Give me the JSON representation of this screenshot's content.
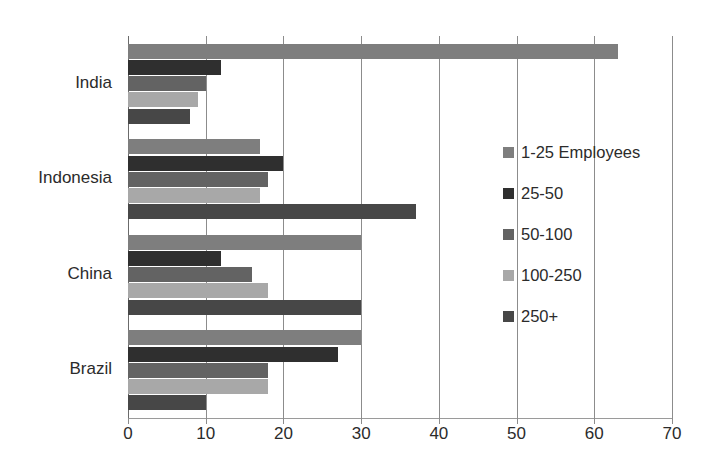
{
  "figure": {
    "top_clipped_text": "",
    "background": "#ffffff"
  },
  "chart_data": {
    "type": "bar",
    "orientation": "horizontal",
    "title": "",
    "subtitle": "",
    "xlabel": "",
    "ylabel": "",
    "xlim": [
      0,
      70
    ],
    "xticks": [
      0,
      10,
      20,
      30,
      40,
      50,
      60,
      70
    ],
    "xtick_labels": [
      "0",
      "10",
      "20",
      "30",
      "40",
      "50",
      "60",
      "70"
    ],
    "grid": "vertical",
    "legend_position": "right-inside",
    "categories": [
      "India",
      "Indonesia",
      "China",
      "Brazil"
    ],
    "series": [
      {
        "name": "1-25 Employees",
        "color": "#7e7e7e",
        "values": [
          63,
          17,
          30,
          30
        ]
      },
      {
        "name": "25-50",
        "color": "#2f2f2f",
        "values": [
          12,
          20,
          12,
          27
        ]
      },
      {
        "name": "50-100",
        "color": "#636363",
        "values": [
          10,
          18,
          16,
          18
        ]
      },
      {
        "name": "100-250",
        "color": "#a8a8a8",
        "values": [
          9,
          17,
          18,
          18
        ]
      },
      {
        "name": "250+",
        "color": "#474747",
        "values": [
          8,
          37,
          30,
          10
        ]
      }
    ]
  },
  "legend": {
    "items": [
      {
        "label": "1-25 Employees",
        "color": "#7e7e7e"
      },
      {
        "label": "25-50",
        "color": "#2f2f2f"
      },
      {
        "label": "50-100",
        "color": "#636363"
      },
      {
        "label": "100-250",
        "color": "#a8a8a8"
      },
      {
        "label": "250+",
        "color": "#474747"
      }
    ]
  },
  "colors": {
    "gridline": "#8c8c8c",
    "axis": "#9a9a9a",
    "text": "#2b2b2b"
  }
}
